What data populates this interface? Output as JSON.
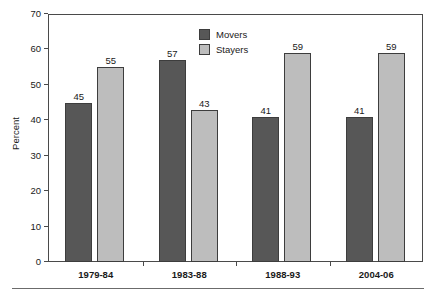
{
  "chart_data": {
    "type": "bar",
    "title": "",
    "xlabel": "",
    "ylabel": "Percent",
    "ylim": [
      0,
      70
    ],
    "ytick_step": 10,
    "yticks": [
      0,
      10,
      20,
      30,
      40,
      50,
      60,
      70
    ],
    "grid": false,
    "legend_position": "inside-top-center",
    "categories": [
      "1979-84",
      "1983-88",
      "1988-93",
      "2004-06"
    ],
    "series": [
      {
        "name": "Movers",
        "color": "#575757",
        "values": [
          45,
          57,
          41,
          41
        ]
      },
      {
        "name": "Stayers",
        "color": "#bdbdbd",
        "values": [
          55,
          43,
          59,
          59
        ]
      }
    ]
  },
  "axis": {
    "y_title": "Percent",
    "tick_labels": [
      "70",
      "60",
      "50",
      "40",
      "30",
      "20",
      "10",
      "0"
    ]
  },
  "legend": {
    "items": [
      {
        "label": "Movers",
        "color": "#575757"
      },
      {
        "label": "Stayers",
        "color": "#bdbdbd"
      }
    ]
  },
  "colors": {
    "movers": "#575757",
    "stayers": "#bdbdbd",
    "axis": "#4a4a4a",
    "bar_outline": "#3d3d3d",
    "text": "#1a1a1a",
    "background": "#ffffff",
    "footer_rule": "#6b6b6b"
  }
}
